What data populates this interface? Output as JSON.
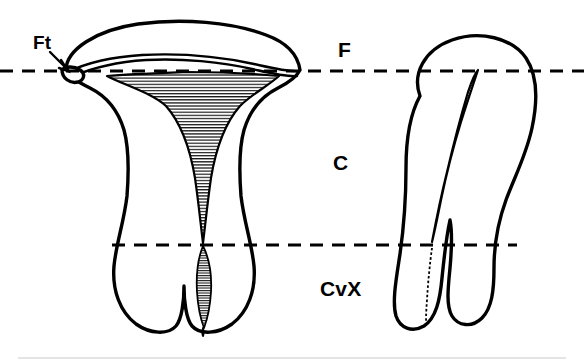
{
  "figure": {
    "background_color": "#ffffff",
    "ink_color": "#000000",
    "rule_color": "#c9c9cd",
    "width": 584,
    "height": 364
  },
  "labels": {
    "fallopian_tube": "Ft",
    "fundus": "F",
    "corpus": "C",
    "cervix": "CvX"
  },
  "reference_lines": [
    {
      "name": "fundus-line",
      "label": "F",
      "y": 71,
      "x_start": 0,
      "x_end": 584,
      "style": "dashed"
    },
    {
      "name": "cervix-line",
      "label": "CvX",
      "y": 245,
      "x_start": 112,
      "x_end": 517,
      "style": "dashed"
    }
  ],
  "views": [
    {
      "name": "coronal-view",
      "description": "Anterior coronal section of uterus with triangular endometrial cavity",
      "cavity_pattern": "horizontal-hatch"
    },
    {
      "name": "sagittal-view",
      "description": "Lateral sagittal section of uterus with narrow slit-like cavity",
      "cavity_pattern": "horizontal-hatch"
    }
  ],
  "annotations": [
    {
      "name": "ft-leader",
      "label": "Ft",
      "points_to": "left-fallopian-tube-ostium"
    }
  ]
}
